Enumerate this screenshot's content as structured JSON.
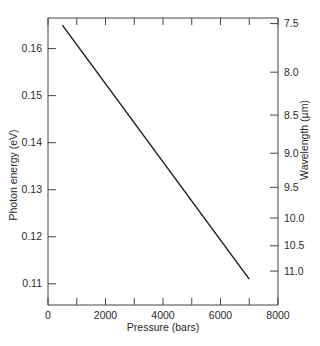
{
  "chart_data": {
    "type": "line",
    "title": "",
    "xlabel": "Pressure (bars)",
    "ylabel": "Photon energy (eV)",
    "y2label": "Wavelength (µm)",
    "xlim": [
      0,
      8000
    ],
    "ylim": [
      0.1055,
      0.1665
    ],
    "x_ticks": [
      0,
      2000,
      4000,
      6000,
      8000
    ],
    "x_tick_labels": [
      "0",
      "2000",
      "4000",
      "6000",
      "8000"
    ],
    "x_minor_ticks": [
      1000,
      3000,
      5000,
      7000
    ],
    "y_ticks": [
      0.11,
      0.12,
      0.13,
      0.14,
      0.15,
      0.16
    ],
    "y_tick_labels": [
      "0.11",
      "0.12",
      "0.13",
      "0.14",
      "0.15",
      "0.16"
    ],
    "y2_ticks": [
      7.5,
      8.0,
      8.5,
      9.0,
      9.5,
      10.0,
      10.5,
      11.0
    ],
    "y2_tick_labels": [
      "7.5",
      "8.0",
      "8.5",
      "9.0",
      "9.5",
      "10.0",
      "10.5",
      "11.0"
    ],
    "grid": false,
    "legend": null,
    "series": [
      {
        "name": "Photon energy vs pressure",
        "x": [
          500,
          7000
        ],
        "y": [
          0.165,
          0.111
        ],
        "color": "#1a1a1a"
      }
    ]
  }
}
